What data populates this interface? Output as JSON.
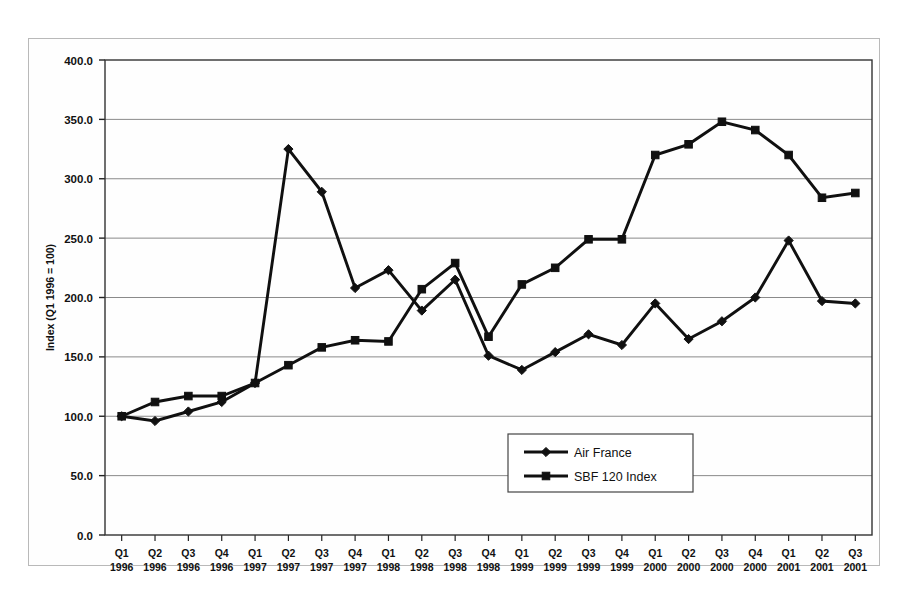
{
  "chart_data": {
    "type": "line",
    "title": "",
    "xlabel": "",
    "ylabel": "Index (Q1 1996 = 100)",
    "ylim": [
      0,
      400
    ],
    "ytick_step": 50,
    "ytick_labels": [
      "0.0",
      "50.0",
      "100.0",
      "150.0",
      "200.0",
      "250.0",
      "300.0",
      "350.0",
      "400.0"
    ],
    "ytick_values": [
      0,
      50,
      100,
      150,
      200,
      250,
      300,
      350,
      400
    ],
    "grid": "horizontal",
    "legend_position": "inside-bottom-center",
    "categories": [
      "Q1 1996",
      "Q2 1996",
      "Q3 1996",
      "Q4 1996",
      "Q1 1997",
      "Q2 1997",
      "Q3 1997",
      "Q4 1997",
      "Q1 1998",
      "Q2 1998",
      "Q3 1998",
      "Q4 1998",
      "Q1 1999",
      "Q2 1999",
      "Q3 1999",
      "Q4 1999",
      "Q1 2000",
      "Q2 2000",
      "Q3 2000",
      "Q4 2000",
      "Q1 2001",
      "Q2 2001",
      "Q3 2001"
    ],
    "category_quarters": [
      "Q1",
      "Q2",
      "Q3",
      "Q4",
      "Q1",
      "Q2",
      "Q3",
      "Q4",
      "Q1",
      "Q2",
      "Q3",
      "Q4",
      "Q1",
      "Q2",
      "Q3",
      "Q4",
      "Q1",
      "Q2",
      "Q3",
      "Q4",
      "Q1",
      "Q2",
      "Q3"
    ],
    "category_years": [
      "1996",
      "1996",
      "1996",
      "1996",
      "1997",
      "1997",
      "1997",
      "1997",
      "1998",
      "1998",
      "1998",
      "1998",
      "1999",
      "1999",
      "1999",
      "1999",
      "2000",
      "2000",
      "2000",
      "2000",
      "2001",
      "2001",
      "2001"
    ],
    "series": [
      {
        "name": "Air France",
        "marker": "diamond",
        "color": "#101010",
        "values": [
          100,
          96,
          104,
          112,
          128,
          325,
          289,
          208,
          223,
          189,
          215,
          151,
          139,
          154,
          169,
          160,
          195,
          165,
          180,
          200,
          248,
          197,
          195
        ]
      },
      {
        "name": "SBF 120 Index",
        "marker": "square",
        "color": "#101010",
        "values": [
          100,
          112,
          117,
          117,
          128,
          143,
          158,
          164,
          163,
          207,
          229,
          167,
          211,
          225,
          249,
          249,
          320,
          329,
          348,
          341,
          320,
          284,
          288
        ]
      }
    ]
  },
  "legend": {
    "entries": [
      {
        "label": "Air France",
        "marker": "diamond"
      },
      {
        "label": "SBF 120 Index",
        "marker": "square"
      }
    ]
  }
}
